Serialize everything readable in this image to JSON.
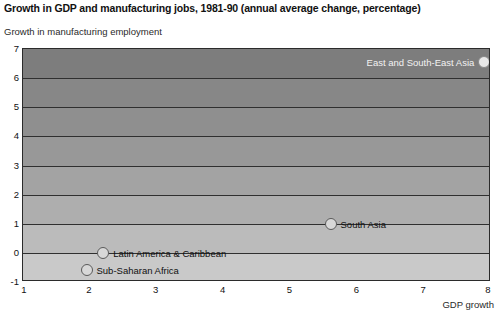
{
  "chart_data": {
    "type": "scatter",
    "title": "Growth in GDP and manufacturing jobs, 1981-90 (annual average change, percentage)",
    "xlabel": "GDP growth",
    "ylabel": "Growth in manufacturing employment",
    "xlim": [
      1,
      8
    ],
    "ylim": [
      -1,
      7
    ],
    "xticks": [
      1,
      2,
      3,
      4,
      5,
      6,
      7,
      8
    ],
    "yticks": [
      -1,
      0,
      1,
      2,
      3,
      4,
      5,
      6,
      7
    ],
    "xtick_labels": [
      "1",
      "2",
      "3",
      "4",
      "5",
      "6",
      "7",
      "8"
    ],
    "ytick_labels": [
      "-1",
      "0",
      "1",
      "2",
      "3",
      "4",
      "5",
      "6",
      "7"
    ],
    "grid": "horizontal",
    "legend": "none",
    "background": "horizontal grey bands, dark at top fading to light at bottom",
    "points": [
      {
        "label": "East and South-East Asia",
        "x": 7.9,
        "y": 6.55,
        "label_side": "left",
        "label_color": "light"
      },
      {
        "label": "South Asia",
        "x": 5.6,
        "y": 1.0,
        "label_side": "right",
        "label_color": "dark"
      },
      {
        "label": "Latin America & Caribbean",
        "x": 2.2,
        "y": 0.0,
        "label_side": "right",
        "label_color": "dark"
      },
      {
        "label": "Sub-Saharan Africa",
        "x": 1.95,
        "y": -0.6,
        "label_side": "right",
        "label_color": "dark"
      }
    ],
    "band_colors": [
      "#7d7d7d",
      "#878787",
      "#8f8f8f",
      "#989898",
      "#a3a3a3",
      "#aeaeae",
      "#bbbbbb",
      "#c9c9c9"
    ]
  }
}
